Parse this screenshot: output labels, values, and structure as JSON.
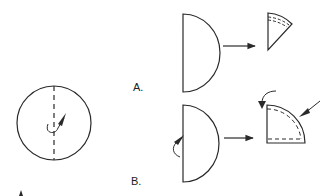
{
  "diagram": {
    "labels": {
      "a": "A.",
      "b": "B."
    },
    "colors": {
      "stroke": "#2a2a2a",
      "background": "#ffffff"
    },
    "steps": [
      {
        "id": "circle",
        "shape": "circle",
        "note": "dashed fold line with rotation arrow"
      },
      {
        "id": "a-half",
        "shape": "semicircle",
        "arrow_to": "a-wedge"
      },
      {
        "id": "a-wedge",
        "shape": "narrow wedge",
        "note": "dashed inner edges"
      },
      {
        "id": "b-half",
        "shape": "semicircle",
        "note": "curved fold arrow at flat edge",
        "arrow_to": "b-quarter"
      },
      {
        "id": "b-quarter",
        "shape": "quarter circle",
        "note": "dashed inner edges, curved arrow and pointing arrow"
      }
    ]
  }
}
